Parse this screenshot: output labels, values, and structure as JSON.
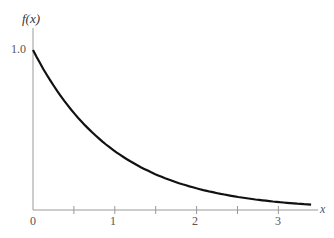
{
  "chart_data": {
    "type": "line",
    "title": "",
    "xlabel": "x",
    "ylabel": "f(x)",
    "function": "f(x) = e^(-x)",
    "xlim": [
      0,
      3.4
    ],
    "ylim": [
      0,
      1.0
    ],
    "x_ticks": [
      0,
      0.5,
      1,
      1.5,
      2,
      2.5,
      3
    ],
    "x_tick_labels": [
      "0",
      "",
      "1",
      "",
      "2",
      "",
      "3"
    ],
    "y_ticks": [
      1.0
    ],
    "y_tick_labels": [
      "1.0"
    ],
    "grid": false,
    "legend": null,
    "series": [
      {
        "name": "f(x)",
        "x": [
          0,
          0.25,
          0.5,
          0.75,
          1.0,
          1.25,
          1.5,
          1.75,
          2.0,
          2.25,
          2.5,
          2.75,
          3.0,
          3.25,
          3.4
        ],
        "values": [
          1.0,
          0.779,
          0.607,
          0.472,
          0.368,
          0.287,
          0.223,
          0.174,
          0.135,
          0.105,
          0.082,
          0.064,
          0.05,
          0.039,
          0.033
        ]
      }
    ],
    "colors": {
      "curve": "#111111",
      "axis": "#888888",
      "text": "#555555"
    }
  },
  "labels": {
    "y_axis": "f(x)",
    "y_tick": "1.0",
    "x_axis": "x",
    "x_tick_0": "0",
    "x_tick_1": "1",
    "x_tick_2": "2",
    "x_tick_3": "3"
  }
}
